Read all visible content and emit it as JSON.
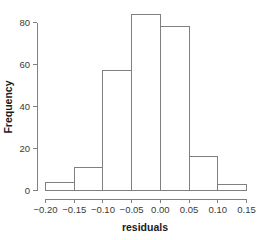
{
  "chart_data": {
    "type": "bar",
    "subtype": "histogram",
    "title": "",
    "xlabel": "residuals",
    "ylabel": "Frequency",
    "categories": [
      "-0.20 to -0.15",
      "-0.15 to -0.10",
      "-0.10 to -0.05",
      "-0.05 to 0.00",
      "0.00 to 0.05",
      "0.05 to 0.10",
      "0.10 to 0.15"
    ],
    "bin_edges": [
      -0.2,
      -0.15,
      -0.1,
      -0.05,
      0.0,
      0.05,
      0.1,
      0.15
    ],
    "values": [
      4,
      11,
      57,
      84,
      78,
      16,
      3
    ],
    "bin_width": 0.05,
    "xlim": [
      -0.2,
      0.15
    ],
    "ylim": [
      0,
      84
    ],
    "x_ticks": [
      -0.2,
      -0.15,
      -0.1,
      -0.05,
      0.0,
      0.05,
      0.1,
      0.15
    ],
    "x_tick_labels": [
      "−0.20",
      "−0.15",
      "−0.10",
      "−0.05",
      "0.00",
      "0.05",
      "0.10",
      "0.15"
    ],
    "y_ticks": [
      0,
      20,
      40,
      60,
      80
    ],
    "y_tick_labels": [
      "0",
      "20",
      "40",
      "60",
      "80"
    ],
    "grid": false,
    "legend": false,
    "legend_position": "none",
    "colors": {
      "background": "#ffffff",
      "bar_fill": "#ffffff",
      "bar_stroke": "#808080",
      "axis": "#808080",
      "tick_label": "#3a3a3a",
      "axis_title": "#1a1a1a"
    }
  },
  "axis": {
    "x_title": "residuals",
    "y_title": "Frequency"
  }
}
